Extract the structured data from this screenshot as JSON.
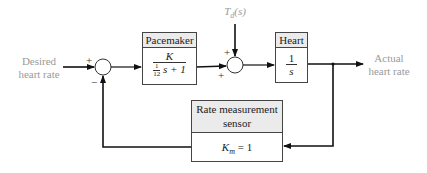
{
  "input_label": {
    "line1": "Desired",
    "line2": "heart rate"
  },
  "output_label": {
    "line1": "Actual",
    "line2": "heart rate"
  },
  "disturbance_label": "T_d(s)",
  "disturbance_parts": {
    "T": "T",
    "sub": "d",
    "arg": "(s)"
  },
  "summing_junction_1": {
    "signs": [
      "+",
      "−"
    ]
  },
  "summing_junction_2": {
    "signs": [
      "+",
      "+"
    ]
  },
  "pacemaker": {
    "title": "Pacemaker",
    "numerator": "K",
    "denominator": {
      "frac_num": "1",
      "frac_den": "12",
      "rest": "s + 1"
    }
  },
  "heart": {
    "title": "Heart",
    "numerator": "1",
    "denominator": "s"
  },
  "sensor": {
    "title_line1": "Rate measurement",
    "title_line2": "sensor",
    "gain": {
      "K": "K",
      "sub": "m",
      "rest": " = 1"
    }
  },
  "colors": {
    "line": "#111111",
    "label": "#9a9a9a",
    "header_bg": "#ebebeb"
  }
}
